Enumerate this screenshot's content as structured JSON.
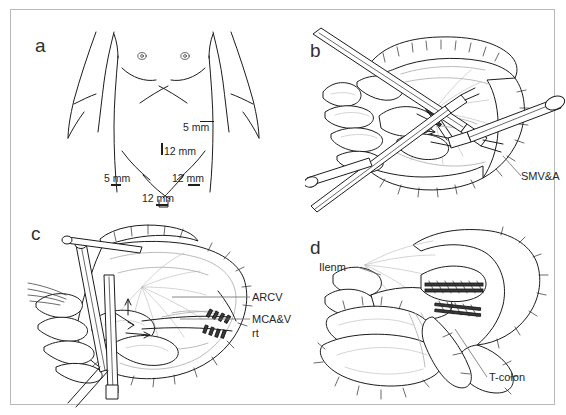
{
  "figure": {
    "kind": "surgical-illustration",
    "panel_count": 4,
    "background_color": "#ffffff",
    "frame_color": "#b8b8b8",
    "ink_color": "#1c1c1c",
    "secondary_ink_color": "#a9a9a9"
  },
  "panels": {
    "a": {
      "letter": "a",
      "caption_kind": "port-placement-diagram",
      "subject": "anterior abdominal wall torso outline",
      "ports": [
        {
          "id": "port-epigastric",
          "label": "5 mm",
          "marker": "line"
        },
        {
          "id": "port-supraumbilical",
          "label": "12 mm",
          "marker": "vertical-bar"
        },
        {
          "id": "port-left-lower",
          "label": "5 mm",
          "marker": "underline"
        },
        {
          "id": "port-right-lower",
          "label": "12 mm",
          "marker": "underline"
        },
        {
          "id": "port-suprapubic",
          "label": "12 mm",
          "marker": "underline"
        }
      ]
    },
    "b": {
      "letter": "b",
      "caption_kind": "intraoperative-view",
      "annotations": [
        {
          "id": "anno-smva",
          "label": "SMV&A"
        }
      ]
    },
    "c": {
      "letter": "c",
      "caption_kind": "intraoperative-view",
      "annotations": [
        {
          "id": "anno-arcv",
          "label": "ARCV"
        },
        {
          "id": "anno-mcav",
          "label": "MCA&V"
        },
        {
          "id": "anno-mcav2",
          "label": "rt"
        }
      ]
    },
    "d": {
      "letter": "d",
      "caption_kind": "anastomosis-view",
      "annotations": [
        {
          "id": "anno-ileum",
          "label": "Ilenm"
        },
        {
          "id": "anno-tcolon",
          "label": "T-colon"
        }
      ]
    }
  }
}
